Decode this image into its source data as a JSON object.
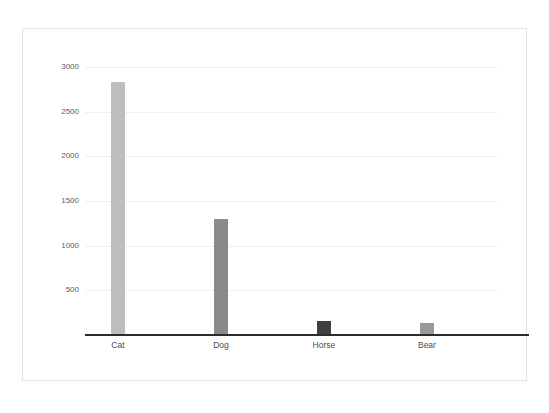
{
  "chart_data": {
    "type": "bar",
    "title": "",
    "subtitle": "",
    "xlabel": "",
    "ylabel": "",
    "categories": [
      "Cat",
      "Dog",
      "Horse",
      "Bear"
    ],
    "values": [
      2830,
      1300,
      160,
      135
    ],
    "bar_colors": [
      "#bdbdbd",
      "#8a8a8a",
      "#3f3f3f",
      "#9a9a9a"
    ],
    "ylim": [
      0,
      3200
    ],
    "yticks": [
      500,
      1000,
      1500,
      2000,
      2500,
      3000
    ],
    "ytick_labels": [
      "500",
      "1000",
      "1500",
      "2000",
      "2500",
      "3000"
    ],
    "grid": true,
    "gridline_color": "#efefef",
    "axis_color": "#2c2c2c",
    "legend": false,
    "legend_position": "none",
    "annotations": [],
    "background": "#ffffff",
    "border_color": "#e2e2e2"
  }
}
